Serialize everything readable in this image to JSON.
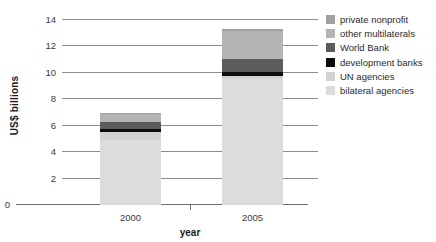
{
  "chart_data": {
    "type": "bar",
    "stacked": true,
    "title": "",
    "xlabel": "year",
    "ylabel": "US$ billions",
    "categories": [
      "2000",
      "2005"
    ],
    "ylim": [
      0,
      14
    ],
    "yticks": [
      0,
      2,
      4,
      6,
      8,
      10,
      12,
      14
    ],
    "ytick_labels": [
      "0",
      "2",
      "4",
      "6",
      "8",
      "10",
      "12",
      "14"
    ],
    "grid": true,
    "legend_position": "right",
    "series": [
      {
        "name": "bilateral agencies",
        "values": [
          4.95,
          9.5
        ],
        "color": "#dcdcdc"
      },
      {
        "name": "UN agencies",
        "values": [
          0.6,
          0.3
        ],
        "color": "#d2d2d2"
      },
      {
        "name": "development banks",
        "values": [
          0.18,
          0.28
        ],
        "color": "#0d0d0d"
      },
      {
        "name": "World Bank",
        "values": [
          0.52,
          0.95
        ],
        "color": "#5c5c5c"
      },
      {
        "name": "other multilaterals",
        "values": [
          0.65,
          2.15
        ],
        "color": "#b4b4b4"
      },
      {
        "name": "private nonprofit",
        "values": [
          0.1,
          0.12
        ],
        "color": "#a0a0a0"
      }
    ],
    "totals": [
      7.0,
      13.3
    ]
  },
  "legend": {
    "items": [
      {
        "label": "private nonprofit",
        "color": "#a0a0a0"
      },
      {
        "label": "other multilaterals",
        "color": "#b4b4b4"
      },
      {
        "label": "World Bank",
        "color": "#5c5c5c"
      },
      {
        "label": "development banks",
        "color": "#0d0d0d"
      },
      {
        "label": "UN agencies",
        "color": "#d2d2d2"
      },
      {
        "label": "bilateral agencies",
        "color": "#dcdcdc"
      }
    ]
  },
  "colors": {
    "gridline": "#8c8c8c",
    "axis": "#6e6e6e",
    "text": "#3a3a3a",
    "title_text": "#1a1a1a",
    "background": "#ffffff"
  }
}
